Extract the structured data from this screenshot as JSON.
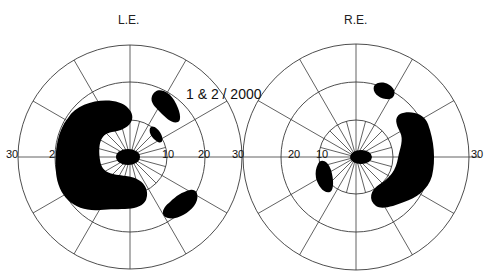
{
  "figure": {
    "type": "visual-field-chart",
    "annotation": "1 & 2 / 2000",
    "colors": {
      "background": "#ffffff",
      "grid": "#3a3a3a",
      "scotoma": "#000000"
    },
    "rings_degrees": [
      10,
      20,
      30
    ],
    "spoke_interval_degrees": 30
  },
  "left_eye": {
    "label": "L.E.",
    "axis_ticks_left": [
      "30",
      "2"
    ],
    "axis_ticks_right": [
      "10",
      "20",
      "30"
    ],
    "scotomas": [
      "central blind spot",
      "large C-shaped temporal scotoma",
      "upper nasal oval scotoma",
      "small paracentral scotoma",
      "lower nasal oval scotoma"
    ]
  },
  "right_eye": {
    "label": "R.E.",
    "axis_ticks_left": [
      "30",
      "20",
      "10"
    ],
    "axis_ticks_right": [
      "1",
      "0",
      "30"
    ],
    "scotomas": [
      "central blind spot",
      "small nasal paracentral scotoma",
      "upper temporal oval scotoma",
      "large crescent temporal scotoma"
    ]
  }
}
